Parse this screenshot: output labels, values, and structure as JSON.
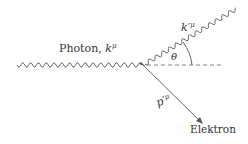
{
  "diagram": {
    "incoming_photon": {
      "label": "Photon, ",
      "momentum_base": "k",
      "momentum_sup": "μ"
    },
    "scattered_photon": {
      "momentum_base": "k′",
      "momentum_sup": "μ"
    },
    "angle": {
      "label": "θ"
    },
    "electron": {
      "label": "Elektron",
      "momentum_base": "p′",
      "momentum_sup": "μ"
    },
    "colors": {
      "line": "#555555",
      "text": "#333333",
      "dashed": "#777777"
    }
  }
}
